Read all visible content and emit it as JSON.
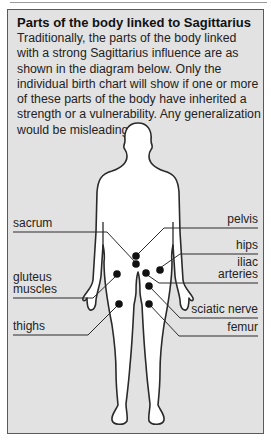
{
  "panel": {
    "title": "Parts of the body linked to Sagittarius",
    "description": "Traditionally, the parts of the body linked with a strong Sagittarius influence are as shown in the diagram below. Only the individual birth chart will show if one or more of these parts of the body have inherited a strength or a vulnerability. Any generalization would be misleading."
  },
  "labels": {
    "left": [
      {
        "id": "sacrum",
        "text": "sacrum"
      },
      {
        "id": "gluteus",
        "line1": "gluteus",
        "line2": "muscles"
      },
      {
        "id": "thighs",
        "text": "thighs"
      }
    ],
    "right": [
      {
        "id": "pelvis",
        "text": "pelvis"
      },
      {
        "id": "hips",
        "text": "hips"
      },
      {
        "id": "iliac",
        "line1": "iliac",
        "line2": "arteries"
      },
      {
        "id": "sciatic",
        "text": "sciatic nerve"
      },
      {
        "id": "femur",
        "text": "femur"
      }
    ]
  },
  "colors": {
    "panel_bg": "#e2e2e2",
    "border": "#5a5a5a",
    "body_fill": "#ffffff",
    "dot": "#111111"
  }
}
